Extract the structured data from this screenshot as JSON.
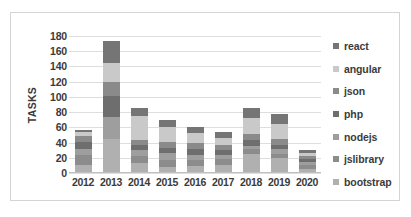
{
  "chart_data": {
    "type": "bar",
    "subtype": "stacked-column",
    "title": "",
    "xlabel": "",
    "ylabel": "TASKS",
    "ylim": [
      0,
      180
    ],
    "ytick_step": 20,
    "yticks": [
      180,
      160,
      140,
      120,
      100,
      80,
      60,
      40,
      20,
      0
    ],
    "grid": true,
    "legend_position": "right",
    "categories": [
      "2012",
      "2013",
      "2014",
      "2015",
      "2016",
      "2017",
      "2018",
      "2019",
      "2020"
    ],
    "series": [
      {
        "name": "bootstrap",
        "color": "#b0b0b0",
        "values": [
          10,
          45,
          13,
          8,
          9,
          11,
          25,
          20,
          5
        ]
      },
      {
        "name": "jslibrary",
        "color": "#8c8c8c",
        "values": [
          14,
          0,
          9,
          9,
          8,
          7,
          6,
          5,
          5
        ]
      },
      {
        "name": "nodejs",
        "color": "#9e9e9e",
        "values": [
          8,
          28,
          8,
          9,
          7,
          6,
          5,
          6,
          5
        ]
      },
      {
        "name": "php",
        "color": "#6e6e6e",
        "values": [
          9,
          28,
          7,
          7,
          7,
          6,
          7,
          6,
          4
        ]
      },
      {
        "name": "json",
        "color": "#8a8a8a",
        "values": [
          8,
          18,
          7,
          8,
          8,
          7,
          8,
          8,
          4
        ]
      },
      {
        "name": "angular",
        "color": "#c9c9c9",
        "values": [
          5,
          26,
          31,
          20,
          13,
          9,
          21,
          19,
          4
        ]
      },
      {
        "name": "react",
        "color": "#757575",
        "values": [
          3,
          29,
          10,
          9,
          9,
          8,
          13,
          13,
          3
        ]
      }
    ],
    "totals": [
      57,
      174,
      85,
      70,
      61,
      54,
      85,
      77,
      30
    ]
  },
  "legend": {
    "items": [
      {
        "label": "react",
        "color": "#757575"
      },
      {
        "label": "angular",
        "color": "#c9c9c9"
      },
      {
        "label": "json",
        "color": "#8a8a8a"
      },
      {
        "label": "php",
        "color": "#6e6e6e"
      },
      {
        "label": "nodejs",
        "color": "#9e9e9e"
      },
      {
        "label": "jslibrary",
        "color": "#8c8c8c"
      },
      {
        "label": "bootstrap",
        "color": "#b0b0b0"
      }
    ]
  },
  "style": {
    "plot_background": "#ffffff",
    "gridline_color": "#dedede",
    "border_color": "#d4d4d4",
    "text_color": "#3b3b3b"
  }
}
